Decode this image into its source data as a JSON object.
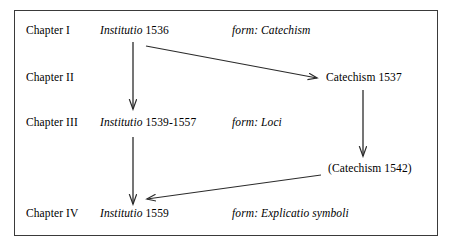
{
  "figure": {
    "border_color": "#3a3a3a",
    "background_color": "#ffffff",
    "text_color": "#000000"
  },
  "rows": [
    {
      "chapter": "Chapter I",
      "work_title": "Institutio",
      "work_date": "1536",
      "form": "form: Catechism"
    },
    {
      "chapter": "Chapter II",
      "work_title": "",
      "work_date": "",
      "form": ""
    },
    {
      "chapter": "Chapter III",
      "work_title": "Institutio",
      "work_date": "1539-1557",
      "form": "form: Loci"
    },
    {
      "chapter": "Chapter IV",
      "work_title": "Institutio",
      "work_date": "1559",
      "form": "form: Explicatio symboli"
    }
  ],
  "right_nodes": [
    {
      "label": "Catechism 1537"
    },
    {
      "label": "(Catechism 1542)"
    }
  ]
}
